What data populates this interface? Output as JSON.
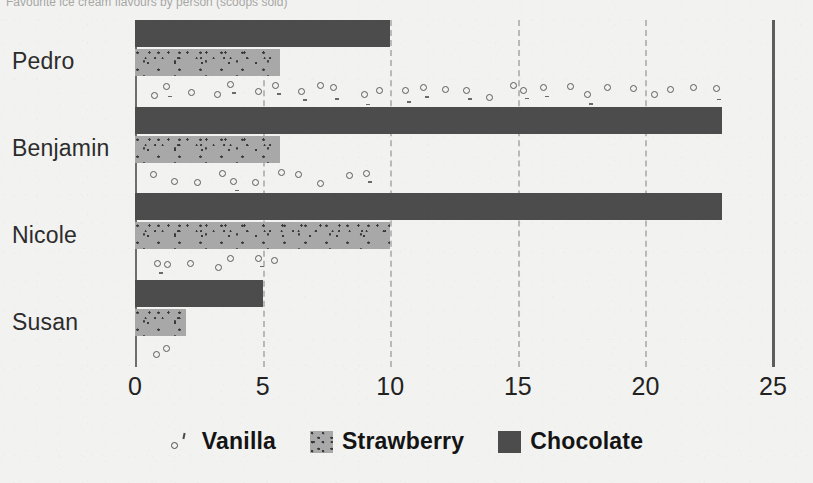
{
  "top_caption": "Favourite ice cream flavours by person (scoops sold)",
  "chart_data": {
    "type": "bar",
    "orientation": "horizontal",
    "title": "",
    "xlabel": "",
    "ylabel": "",
    "categories": [
      "Pedro",
      "Benjamin",
      "Nicole",
      "Susan"
    ],
    "series": [
      {
        "name": "Vanilla",
        "values": [
          23,
          9.4,
          5.7,
          1.5
        ],
        "color": "#5a5a5a",
        "pattern": "open-circles"
      },
      {
        "name": "Strawberry",
        "values": [
          5.7,
          5.7,
          10,
          2
        ],
        "color": "#a8a8a8",
        "pattern": "speckled"
      },
      {
        "name": "Chocolate",
        "values": [
          10,
          23,
          23,
          5
        ],
        "color": "#4c4c4c",
        "pattern": "solid"
      }
    ],
    "bar_order_top_to_bottom": [
      "Chocolate",
      "Strawberry",
      "Vanilla"
    ],
    "xlim": [
      0,
      25
    ],
    "xticks": [
      0,
      5,
      10,
      15,
      20,
      25
    ],
    "xtick_labels": [
      "0",
      "5",
      "10",
      "15",
      "20",
      "25"
    ],
    "grid": {
      "x": true,
      "style": "dashed",
      "color": "#b9b9b7"
    },
    "legend": {
      "position": "bottom",
      "entries": [
        "Vanilla",
        "Strawberry",
        "Chocolate"
      ]
    }
  },
  "axis": {
    "left_line_color": "#6e6e6e",
    "right_line_color": "#5d5d5d"
  },
  "legend": {
    "items": [
      {
        "label": "Vanilla",
        "swatch": "vanilla-swatch"
      },
      {
        "label": "Strawberry",
        "swatch": "strawberry-swatch"
      },
      {
        "label": "Chocolate",
        "swatch": "chocolate-swatch"
      }
    ]
  },
  "background_color": "#f2f2f0"
}
